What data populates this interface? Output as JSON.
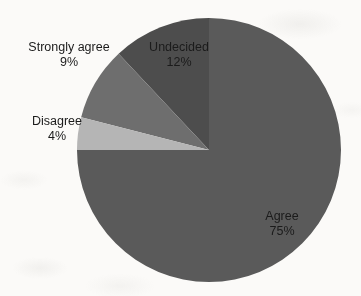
{
  "chart_data": {
    "type": "pie",
    "title": "",
    "subtitle": "",
    "xlabel": "",
    "ylabel": "",
    "grid": false,
    "legend_position": "none",
    "labels_position": "around-and-inside-slices",
    "start_angle_deg": 90,
    "direction": "counterclockwise",
    "units": "percent",
    "categories": [
      "Undecided",
      "Strongly agree",
      "Disagree",
      "Agree"
    ],
    "values": [
      12,
      9,
      4,
      75
    ],
    "colors": [
      "#4d4d4d",
      "#6e6e6e",
      "#b5b5b5",
      "#5a5a5a"
    ],
    "slices": [
      {
        "name": "Undecided",
        "value": 12,
        "value_text": "12%",
        "color": "#4d4d4d",
        "start_deg": 90,
        "end_deg": 133.2,
        "label_placement": "inside"
      },
      {
        "name": "Strongly agree",
        "value": 9,
        "value_text": "9%",
        "color": "#6e6e6e",
        "start_deg": 133.2,
        "end_deg": 165.6,
        "label_placement": "outside"
      },
      {
        "name": "Disagree",
        "value": 4,
        "value_text": "4%",
        "color": "#b5b5b5",
        "start_deg": 165.6,
        "end_deg": 180.0,
        "label_placement": "outside"
      },
      {
        "name": "Agree",
        "value": 75,
        "value_text": "75%",
        "color": "#5a5a5a",
        "start_deg": 180.0,
        "end_deg": 450.0,
        "label_placement": "inside"
      }
    ],
    "geometry": {
      "center_x": 209,
      "center_y": 150,
      "radius": 132
    }
  },
  "labels": {
    "strongly_agree": {
      "name": "Strongly agree",
      "pct": "9%"
    },
    "undecided": {
      "name": "Undecided",
      "pct": "12%"
    },
    "disagree": {
      "name": "Disagree",
      "pct": "4%"
    },
    "agree": {
      "name": "Agree",
      "pct": "75%"
    }
  },
  "colors": {
    "background": "#fbfaf8",
    "text": "#1b1b1b",
    "agree": "#5a5a5a",
    "undecided": "#4d4d4d",
    "strongly_agree": "#6e6e6e",
    "disagree": "#b5b5b5"
  }
}
